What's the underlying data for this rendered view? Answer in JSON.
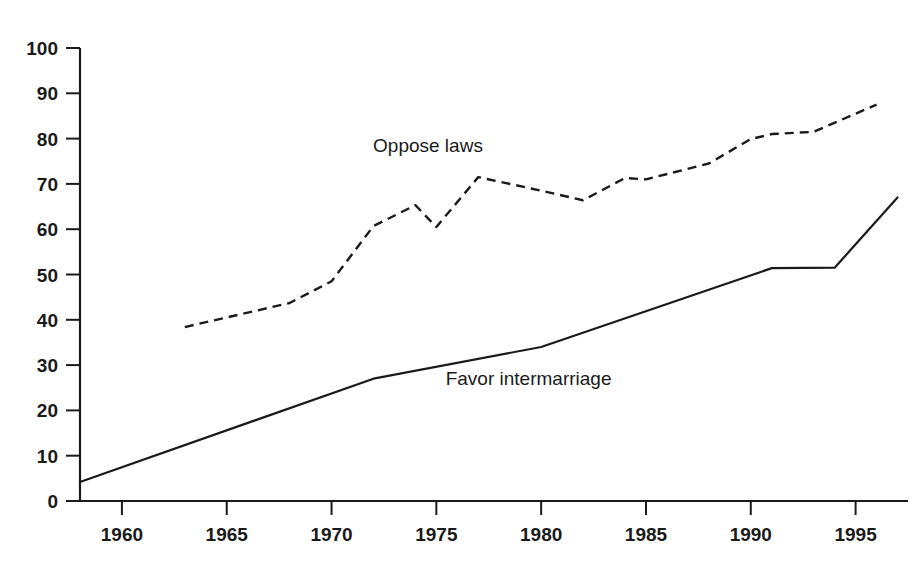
{
  "chart_data": {
    "type": "line",
    "title": "",
    "subtitle": "",
    "xlabel": "",
    "ylabel": "",
    "xlim": [
      1958,
      1997.5
    ],
    "ylim": [
      0,
      100
    ],
    "grid": false,
    "legend_position": "inline-annotations",
    "x_tick_labels": [
      "1960",
      "1965",
      "1970",
      "1975",
      "1980",
      "1985",
      "1990",
      "1995"
    ],
    "x_ticks": [
      1960,
      1965,
      1970,
      1975,
      1980,
      1985,
      1990,
      1995
    ],
    "y_tick_labels": [
      "0",
      "10",
      "20",
      "30",
      "40",
      "50",
      "60",
      "70",
      "80",
      "90",
      "100"
    ],
    "y_ticks": [
      0,
      10,
      20,
      30,
      40,
      50,
      60,
      70,
      80,
      90,
      100
    ],
    "series": [
      {
        "name": "Oppose laws",
        "style": "dashed",
        "color": "#1a1a1a",
        "x": [
          1963,
          1968,
          1970,
          1972,
          1974,
          1975,
          1977,
          1980,
          1982,
          1984,
          1985,
          1988,
          1990,
          1991,
          1993,
          1996
        ],
        "values": [
          38.4,
          43.7,
          48.5,
          60.7,
          65.3,
          60.5,
          71.5,
          68.5,
          66.4,
          71.3,
          71.0,
          74.5,
          79.9,
          81.0,
          81.5,
          87.5
        ]
      },
      {
        "name": "Favor intermarriage",
        "style": "solid",
        "color": "#1a1a1a",
        "x": [
          1958,
          1972,
          1980,
          1991,
          1994,
          1997
        ],
        "values": [
          4.2,
          27.0,
          34.0,
          51.4,
          51.5,
          67.0
        ]
      }
    ],
    "annotations": [
      {
        "text": "Oppose laws",
        "x": 1974.6,
        "y": 77.0
      },
      {
        "text": "Favor intermarriage",
        "x": 1979.4,
        "y": 25.6
      }
    ]
  }
}
